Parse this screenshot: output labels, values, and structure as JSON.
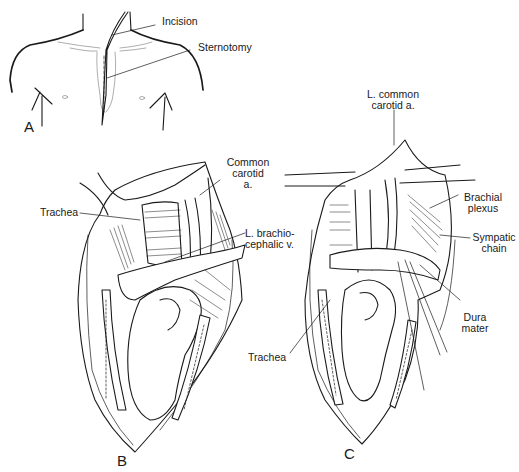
{
  "figure": {
    "panels": [
      {
        "id": "A",
        "label": "A",
        "description": "Anterior chest outline showing incision and sternotomy line"
      },
      {
        "id": "B",
        "label": "B",
        "description": "Opened sternotomy exposing mediastinal structures"
      },
      {
        "id": "C",
        "label": "C",
        "description": "Retracted view exposing cervicothoracic structures"
      }
    ],
    "labels": {
      "incision": "Incision",
      "sternotomy": "Sternotomy",
      "b_common_carotid_1": "Common",
      "b_common_carotid_2": "carotid",
      "b_common_carotid_3": "a.",
      "b_trachea": "Trachea",
      "b_brachiocephalic_1": "L. brachio-",
      "b_brachiocephalic_2": "cephalic v.",
      "c_common_carotid_1": "L. common",
      "c_common_carotid_2": "carotid a.",
      "c_brachial_1": "Brachial",
      "c_brachial_2": "plexus",
      "c_sympathetic_1": "Sympatic",
      "c_sympathetic_2": "chain",
      "c_dura_1": "Dura",
      "c_dura_2": "mater",
      "c_trachea": "Trachea"
    }
  }
}
